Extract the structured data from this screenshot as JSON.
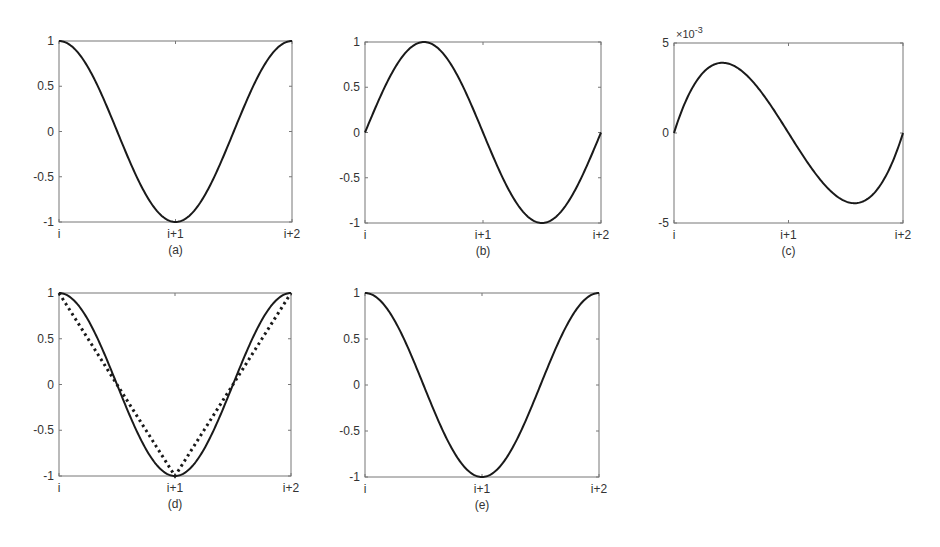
{
  "figure": {
    "subplots": [
      {
        "id": "a",
        "caption": "(a)",
        "box": [
          59,
          41,
          292,
          222
        ]
      },
      {
        "id": "b",
        "caption": "(b)",
        "box": [
          365,
          42,
          601,
          223
        ]
      },
      {
        "id": "c",
        "caption": "(c)",
        "box": [
          674,
          43,
          903,
          223
        ]
      },
      {
        "id": "d",
        "caption": "(d)",
        "box": [
          59,
          293,
          291,
          476
        ]
      },
      {
        "id": "e",
        "caption": "(e)",
        "box": [
          365,
          293,
          599,
          477
        ]
      }
    ],
    "colors": {
      "line": "#1a1a1a",
      "axis": "#777777",
      "text": "#333333"
    }
  },
  "chart_data": [
    {
      "type": "line",
      "title": "(a)",
      "xlabel": "",
      "ylabel": "",
      "x_ticks": [
        "i",
        "i+1",
        "i+2"
      ],
      "y_ticks": [
        "-1",
        "-0.5",
        "0",
        "0.5",
        "1"
      ],
      "xlim": [
        0,
        2
      ],
      "ylim": [
        -1,
        1
      ],
      "grid": false,
      "series": [
        {
          "name": "cos(pi*t)",
          "style": "solid",
          "function": "cos",
          "x": [
            0,
            0.25,
            0.5,
            0.75,
            1,
            1.25,
            1.5,
            1.75,
            2
          ],
          "values": [
            1,
            0.71,
            0,
            -0.71,
            -1,
            -0.71,
            0,
            0.71,
            1
          ]
        }
      ]
    },
    {
      "type": "line",
      "title": "(b)",
      "xlabel": "",
      "ylabel": "",
      "x_ticks": [
        "i",
        "i+1",
        "i+2"
      ],
      "y_ticks": [
        "-1",
        "-0.5",
        "0",
        "0.5",
        "1"
      ],
      "xlim": [
        0,
        2
      ],
      "ylim": [
        -1,
        1
      ],
      "grid": false,
      "series": [
        {
          "name": "sin(pi*t)",
          "style": "solid",
          "function": "sin",
          "x": [
            0,
            0.25,
            0.5,
            0.75,
            1,
            1.25,
            1.5,
            1.75,
            2
          ],
          "values": [
            0,
            0.71,
            1,
            0.71,
            0,
            -0.71,
            -1,
            -0.71,
            0
          ]
        }
      ]
    },
    {
      "type": "line",
      "title": "(c)",
      "xlabel": "",
      "ylabel": "",
      "x_ticks": [
        "i",
        "i+1",
        "i+2"
      ],
      "y_ticks": [
        "-5",
        "0",
        "5"
      ],
      "y_multiplier": "×10",
      "y_exponent": "-3",
      "xlim": [
        0,
        2
      ],
      "ylim": [
        -5,
        5
      ],
      "grid": false,
      "series": [
        {
          "name": "error (×10^-3)",
          "style": "solid",
          "function": "cubic_err",
          "x": [
            0,
            0.2,
            0.42,
            0.7,
            1,
            1.3,
            1.58,
            1.8,
            2
          ],
          "values": [
            0,
            2.9,
            3.9,
            2.5,
            0,
            -2.5,
            -3.9,
            -2.9,
            0
          ]
        }
      ]
    },
    {
      "type": "line",
      "title": "(d)",
      "xlabel": "",
      "ylabel": "",
      "x_ticks": [
        "i",
        "i+1",
        "i+2"
      ],
      "y_ticks": [
        "-1",
        "-0.5",
        "0",
        "0.5",
        "1"
      ],
      "xlim": [
        0,
        2
      ],
      "ylim": [
        -1,
        1
      ],
      "grid": false,
      "series": [
        {
          "name": "cos(pi*t)",
          "style": "solid",
          "function": "cos",
          "x": [
            0,
            0.5,
            1,
            1.5,
            2
          ],
          "values": [
            1,
            0,
            -1,
            0,
            1
          ]
        },
        {
          "name": "linear",
          "style": "dotted",
          "function": "triangle",
          "x": [
            0,
            1,
            2
          ],
          "values": [
            1,
            -1,
            1
          ]
        }
      ]
    },
    {
      "type": "line",
      "title": "(e)",
      "xlabel": "",
      "ylabel": "",
      "x_ticks": [
        "i",
        "i+1",
        "i+2"
      ],
      "y_ticks": [
        "-1",
        "-0.5",
        "0",
        "0.5",
        "1"
      ],
      "xlim": [
        0,
        2
      ],
      "ylim": [
        -1,
        1
      ],
      "grid": false,
      "series": [
        {
          "name": "cos(pi*t)",
          "style": "solid",
          "function": "cos",
          "x": [
            0,
            0.5,
            1,
            1.5,
            2
          ],
          "values": [
            1,
            0,
            -1,
            0,
            1
          ]
        }
      ]
    }
  ]
}
